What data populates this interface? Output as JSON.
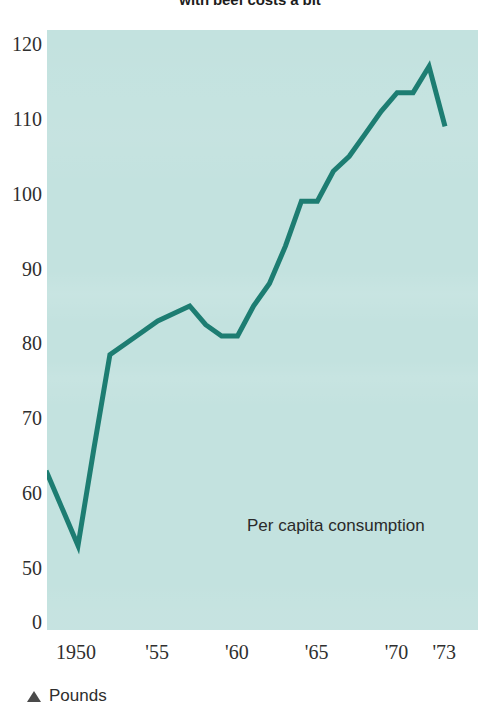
{
  "headline": "with beef costs a bit",
  "annotation": "Per capita consumption",
  "caption": {
    "marker_icon": "triangle-up-icon",
    "text": "Pounds"
  },
  "axis": {
    "y_ticks": [
      {
        "label": "120",
        "value": 120
      },
      {
        "label": "110",
        "value": 110
      },
      {
        "label": "100",
        "value": 100
      },
      {
        "label": "90",
        "value": 90
      },
      {
        "label": "80",
        "value": 80
      },
      {
        "label": "70",
        "value": 70
      },
      {
        "label": "60",
        "value": 60
      },
      {
        "label": "50",
        "value": 50
      },
      {
        "label": "0",
        "value": 0
      }
    ],
    "x_ticks": [
      {
        "label": "1950",
        "value": 1950
      },
      {
        "label": "'55",
        "value": 1955
      },
      {
        "label": "'60",
        "value": 1960
      },
      {
        "label": "'65",
        "value": 1965
      },
      {
        "label": "'70",
        "value": 1970
      },
      {
        "label": "'73",
        "value": 1973
      }
    ]
  },
  "colors": {
    "plot_background": "#c3e2df",
    "series_line": "#1d7d72",
    "text": "#2f2f2f"
  },
  "chart_data": {
    "type": "line",
    "title": "with beef costs a bit",
    "xlabel": "",
    "ylabel": "Pounds",
    "annotations": [
      "Per capita consumption"
    ],
    "grid": false,
    "legend": "none",
    "axis_break": "y-axis broken between 0 and 50",
    "xlim": [
      1948,
      1973
    ],
    "ylim": [
      0,
      120
    ],
    "y_display_ticks": [
      0,
      50,
      60,
      70,
      80,
      90,
      100,
      110,
      120
    ],
    "x_display_ticks": [
      1950,
      1955,
      1960,
      1965,
      1970,
      1973
    ],
    "series": [
      {
        "name": "Per capita consumption",
        "units": "pounds",
        "x": [
          1948,
          1949,
          1950,
          1951,
          1952,
          1953,
          1954,
          1955,
          1956,
          1957,
          1958,
          1959,
          1960,
          1961,
          1962,
          1963,
          1964,
          1965,
          1966,
          1967,
          1968,
          1969,
          1970,
          1971,
          1972,
          1973
        ],
        "values": [
          63,
          58,
          53,
          66,
          78.5,
          80,
          81.5,
          83,
          84,
          85,
          82.5,
          81,
          81,
          85,
          88,
          93,
          99,
          99,
          103,
          105,
          108,
          111,
          113.5,
          113.5,
          117,
          109
        ]
      }
    ]
  }
}
